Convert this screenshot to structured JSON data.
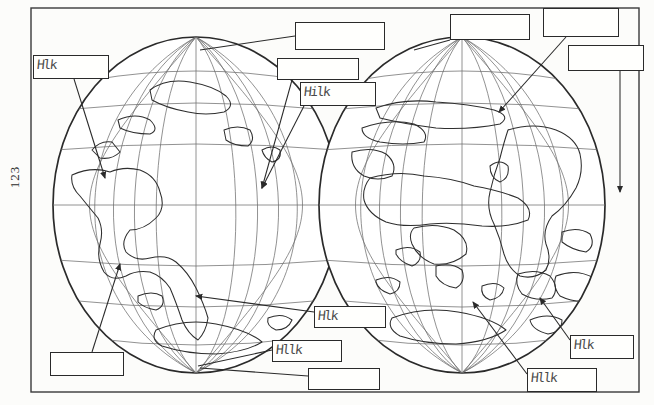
{
  "document": {
    "page_number": "123",
    "type": "worksheet",
    "title_visible": false
  },
  "frame": {
    "x": 31,
    "y": 8,
    "width": 608,
    "height": 384
  },
  "globes": [
    {
      "name": "western-hemisphere-globe",
      "cx": 196,
      "cy": 205,
      "rx": 143,
      "ry": 168,
      "meridian_count": 11,
      "parallel_count": 7,
      "continents": [
        "North America",
        "South America",
        "Greenland",
        "Antarctica"
      ]
    },
    {
      "name": "eastern-hemisphere-globe",
      "cx": 462,
      "cy": 205,
      "rx": 143,
      "ry": 168,
      "meridian_count": 11,
      "parallel_count": 7,
      "continents": [
        "Europe",
        "Asia",
        "Africa",
        "Australia",
        "Antarctica"
      ]
    }
  ],
  "label_boxes": [
    {
      "id": "box-left-upper",
      "x": 33,
      "y": 55,
      "w": 76,
      "h": 24,
      "marks": "Hlk"
    },
    {
      "id": "box-top-center-left",
      "x": 295,
      "y": 22,
      "w": 90,
      "h": 28,
      "marks": ""
    },
    {
      "id": "box-top-center-mid",
      "x": 277,
      "y": 58,
      "w": 82,
      "h": 22,
      "marks": ""
    },
    {
      "id": "box-top-center-right",
      "x": 300,
      "y": 82,
      "w": 76,
      "h": 24,
      "marks": "Hilk"
    },
    {
      "id": "box-top-right-a",
      "x": 450,
      "y": 14,
      "w": 80,
      "h": 26,
      "marks": ""
    },
    {
      "id": "box-top-right-b",
      "x": 543,
      "y": 8,
      "w": 76,
      "h": 29,
      "marks": ""
    },
    {
      "id": "box-top-right-c",
      "x": 568,
      "y": 45,
      "w": 76,
      "h": 26,
      "marks": ""
    },
    {
      "id": "box-bottom-left",
      "x": 50,
      "y": 352,
      "w": 74,
      "h": 24,
      "marks": ""
    },
    {
      "id": "box-bottom-center-a",
      "x": 314,
      "y": 306,
      "w": 72,
      "h": 22,
      "marks": "Hlk"
    },
    {
      "id": "box-bottom-center-b",
      "x": 272,
      "y": 340,
      "w": 70,
      "h": 22,
      "marks": "Hllk"
    },
    {
      "id": "box-bottom-center-c",
      "x": 308,
      "y": 368,
      "w": 72,
      "h": 22,
      "marks": ""
    },
    {
      "id": "box-bottom-right-a",
      "x": 570,
      "y": 335,
      "w": 64,
      "h": 24,
      "marks": "Hlk"
    },
    {
      "id": "box-bottom-right-b",
      "x": 527,
      "y": 368,
      "w": 70,
      "h": 24,
      "marks": "Hllk"
    }
  ],
  "leader_lines": [
    {
      "from": "box-left-upper",
      "to_x": 105,
      "to_y": 180,
      "arrow": true
    },
    {
      "from": "box-top-center-left",
      "to_x": 197,
      "to_y": 52,
      "arrow": false
    },
    {
      "from": "box-top-center-mid",
      "to_x": 262,
      "to_y": 190,
      "arrow": true
    },
    {
      "from": "box-top-center-right",
      "to_x": 262,
      "to_y": 190,
      "arrow": true
    },
    {
      "from": "box-top-right-a",
      "to_x": 417,
      "to_y": 52,
      "arrow": false
    },
    {
      "from": "box-top-right-b",
      "to_x": 497,
      "to_y": 115,
      "arrow": true
    },
    {
      "from": "box-top-right-c",
      "to_x": 620,
      "to_y": 195,
      "arrow": true
    },
    {
      "from": "box-bottom-left",
      "to_x": 120,
      "to_y": 262,
      "arrow": true
    },
    {
      "from": "box-bottom-center-a",
      "to_x": 193,
      "to_y": 297,
      "arrow": true
    },
    {
      "from": "box-bottom-center-b",
      "to_x": 197,
      "to_y": 366,
      "arrow": false
    },
    {
      "from": "box-bottom-center-c",
      "to_x": 197,
      "to_y": 366,
      "arrow": false
    },
    {
      "from": "box-bottom-right-a",
      "to_x": 538,
      "to_y": 295,
      "arrow": true
    },
    {
      "from": "box-bottom-right-b",
      "to_x": 470,
      "to_y": 300,
      "arrow": true
    }
  ],
  "ink": {
    "line_color": "#2a2a2a",
    "grid_color": "#6a6a6a",
    "paper": "#fcfcfa"
  }
}
